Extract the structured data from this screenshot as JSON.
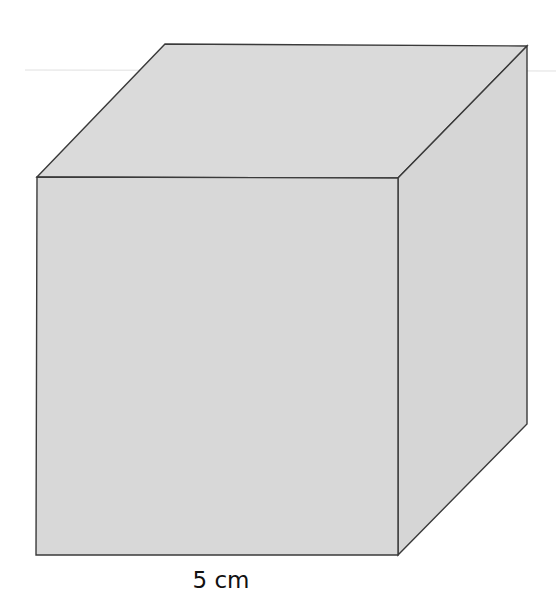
{
  "diagram": {
    "shape": "cube",
    "colors": {
      "face_fill": "#d9d9d9",
      "edge_stroke": "#3a3a3a",
      "background": "#ffffff",
      "label_color": "#111111"
    },
    "labels": {
      "edge_length": "5 cm"
    },
    "vertices": {
      "front_top_left": [
        37,
        177
      ],
      "front_top_right": [
        398,
        178
      ],
      "front_bottom_left": [
        36,
        555
      ],
      "front_bottom_right": [
        398,
        555
      ],
      "back_top_left": [
        165,
        44
      ],
      "back_top_right": [
        527,
        46
      ],
      "back_bottom_right": [
        527,
        424
      ]
    }
  }
}
